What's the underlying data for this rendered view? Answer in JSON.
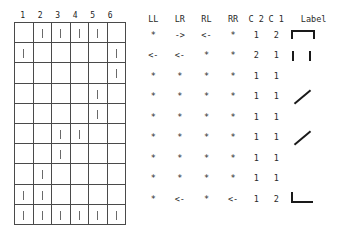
{
  "grid": {
    "col_headers": [
      "1",
      "2",
      "3",
      "4",
      "5",
      "6"
    ],
    "num_rows": 10,
    "num_cols": 6,
    "rows": [
      [
        0,
        1,
        1,
        1,
        1,
        0
      ],
      [
        1,
        0,
        0,
        0,
        0,
        1
      ],
      [
        0,
        0,
        0,
        0,
        0,
        1
      ],
      [
        0,
        0,
        0,
        0,
        1,
        0
      ],
      [
        0,
        0,
        0,
        0,
        1,
        0
      ],
      [
        0,
        0,
        1,
        1,
        0,
        0
      ],
      [
        0,
        0,
        1,
        0,
        0,
        0
      ],
      [
        0,
        1,
        0,
        0,
        0,
        0
      ],
      [
        1,
        1,
        0,
        0,
        0,
        0
      ],
      [
        1,
        1,
        1,
        1,
        1,
        1
      ]
    ]
  },
  "table": {
    "headers": [
      "LL",
      "LR",
      "RL",
      "RR",
      "C 2",
      "C 1",
      "Label"
    ],
    "rows": [
      {
        "LL": "*",
        "LR": "->",
        "RL": "<-",
        "RR": "*",
        "C2": "1",
        "C1": "2",
        "label": "bracket-down"
      },
      {
        "LL": "<-",
        "LR": "<-",
        "RL": "*",
        "RR": "*",
        "C2": "2",
        "C1": "1",
        "label": "two-bars"
      },
      {
        "LL": "*",
        "LR": "*",
        "RL": "*",
        "RR": "*",
        "C2": "1",
        "C1": "1",
        "label": "none"
      },
      {
        "LL": "*",
        "LR": "*",
        "RL": "*",
        "RR": "*",
        "C2": "1",
        "C1": "1",
        "label": "diagonal"
      },
      {
        "LL": "*",
        "LR": "*",
        "RL": "*",
        "RR": "*",
        "C2": "1",
        "C1": "1",
        "label": "none"
      },
      {
        "LL": "*",
        "LR": "*",
        "RL": "*",
        "RR": "*",
        "C2": "1",
        "C1": "1",
        "label": "diagonal"
      },
      {
        "LL": "*",
        "LR": "*",
        "RL": "*",
        "RR": "*",
        "C2": "1",
        "C1": "1",
        "label": "none"
      },
      {
        "LL": "*",
        "LR": "*",
        "RL": "*",
        "RR": "*",
        "C2": "1",
        "C1": "1",
        "label": "none"
      },
      {
        "LL": "*",
        "LR": "<-",
        "RL": "*",
        "RR": "<-",
        "C2": "1",
        "C1": "2",
        "label": "corner-l"
      }
    ]
  },
  "colors": {
    "text": "#2a2a2a",
    "grid_line": "#4a4a4a",
    "tick": "#6a6a6a",
    "glyph": "#1a1a1a",
    "background": "#ffffff"
  }
}
